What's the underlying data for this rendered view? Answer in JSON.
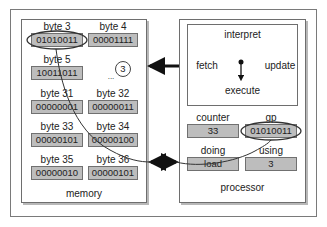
{
  "memory": {
    "title": "memory",
    "bytes": [
      {
        "label": "byte 3",
        "value": "01010011"
      },
      {
        "label": "byte 4",
        "value": "00001111"
      },
      {
        "label": "byte 5",
        "value": "10011011"
      },
      {
        "label": "byte 31",
        "value": "00000001"
      },
      {
        "label": "byte 32",
        "value": "00000011"
      },
      {
        "label": "byte 33",
        "value": "00000101"
      },
      {
        "label": "byte 34",
        "value": "00000100"
      },
      {
        "label": "byte 35",
        "value": "00000010"
      },
      {
        "label": "byte 36",
        "value": "00000101"
      }
    ],
    "ellipsis": "...",
    "circled_number": "3"
  },
  "processor": {
    "title": "processor",
    "cycle": {
      "interpret": "interpret",
      "fetch": "fetch",
      "update": "update",
      "execute": "execute"
    },
    "registers": [
      {
        "label": "counter",
        "value": "33"
      },
      {
        "label": "gp",
        "value": "01010011"
      },
      {
        "label": "doing",
        "value": "load"
      },
      {
        "label": "using",
        "value": "3"
      }
    ]
  },
  "colors": {
    "cell_fill": "#bdbdbd",
    "border": "#6e6e6e",
    "arrow": "#111111"
  }
}
